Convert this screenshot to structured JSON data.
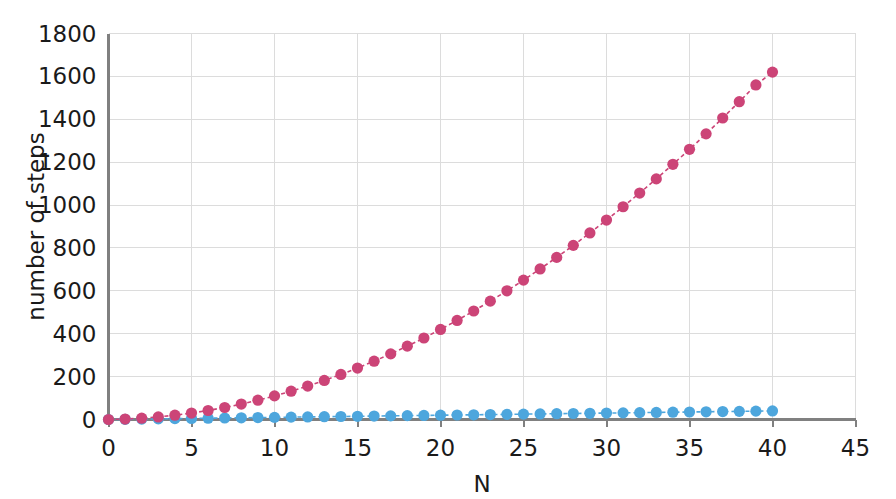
{
  "chart_data": {
    "type": "scatter",
    "title": "",
    "xlabel": "N",
    "ylabel": "number of steps",
    "xlim": [
      0,
      45
    ],
    "ylim": [
      0,
      1800
    ],
    "grid": true,
    "legend": "none",
    "xticks": [
      0,
      5,
      10,
      15,
      20,
      25,
      30,
      35,
      40,
      45
    ],
    "yticks": [
      0,
      200,
      400,
      600,
      800,
      1000,
      1200,
      1400,
      1600,
      1800
    ],
    "xtick_labels": [
      "0",
      "5",
      "10",
      "15",
      "20",
      "25",
      "30",
      "35",
      "40",
      "45"
    ],
    "ytick_labels": [
      "0",
      "200",
      "400",
      "600",
      "800",
      "1000",
      "1200",
      "1400",
      "1600",
      "1800"
    ],
    "x": [
      0,
      1,
      2,
      3,
      4,
      5,
      6,
      7,
      8,
      9,
      10,
      11,
      12,
      13,
      14,
      15,
      16,
      17,
      18,
      19,
      20,
      21,
      22,
      23,
      24,
      25,
      26,
      27,
      28,
      29,
      30,
      31,
      32,
      33,
      34,
      35,
      36,
      37,
      38,
      39,
      40
    ],
    "series": [
      {
        "name": "quadratic",
        "color": "#cc4477",
        "marker": "circle",
        "linestyle": "dashed",
        "values": [
          0,
          2,
          6,
          12,
          20,
          30,
          42,
          56,
          72,
          90,
          110,
          132,
          156,
          182,
          210,
          240,
          272,
          306,
          342,
          380,
          420,
          462,
          506,
          552,
          600,
          650,
          702,
          756,
          812,
          870,
          930,
          992,
          1056,
          1122,
          1190,
          1260,
          1332,
          1406,
          1482,
          1560,
          1620
        ]
      },
      {
        "name": "linear",
        "color": "#4da6dd",
        "marker": "circle",
        "linestyle": "dashed",
        "values": [
          0,
          1,
          2,
          3,
          4,
          5,
          6,
          7,
          8,
          9,
          10,
          11,
          12,
          13,
          14,
          15,
          16,
          17,
          18,
          19,
          20,
          21,
          22,
          23,
          24,
          25,
          26,
          27,
          28,
          29,
          30,
          31,
          32,
          33,
          34,
          35,
          36,
          37,
          38,
          39,
          40
        ]
      }
    ]
  },
  "colors": {
    "series_red": "#cc4477",
    "series_blue": "#4da6dd",
    "grid": "#dcdcdc",
    "axis": "#808080",
    "text": "#1a1a1a",
    "background": "#ffffff"
  }
}
